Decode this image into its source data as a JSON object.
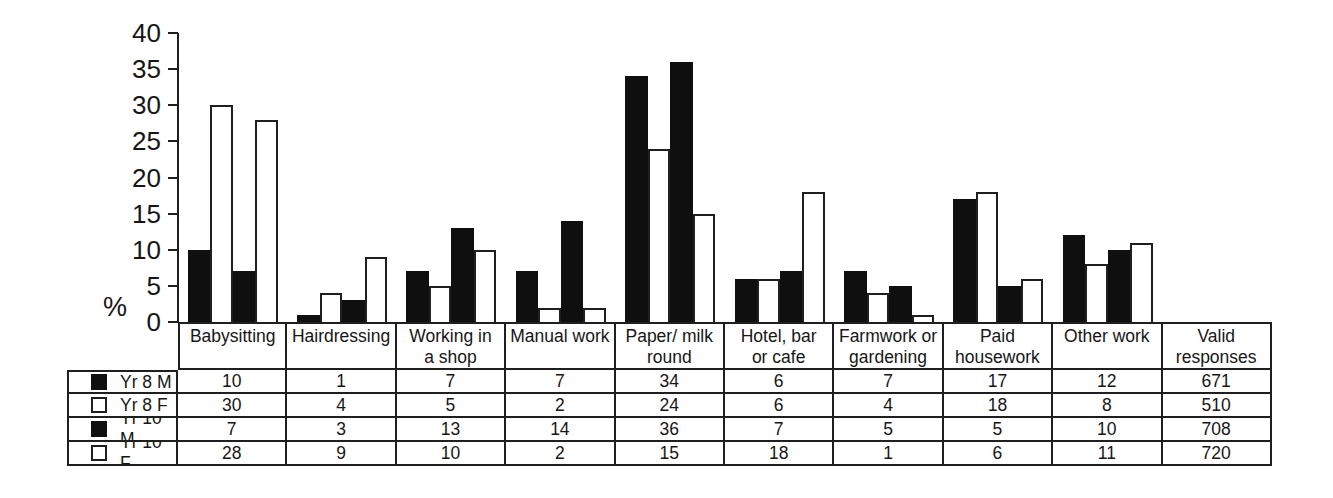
{
  "figure": {
    "background": "#ffffff",
    "line_color": "#1f1f1f",
    "bar_fill_dark": "#0f0f0f",
    "bar_fill_light": "#ffffff"
  },
  "chart": {
    "ylabel": "%",
    "yticks": [
      40,
      35,
      30,
      25,
      20,
      15,
      10,
      5,
      0
    ]
  },
  "chart_data": {
    "type": "bar",
    "title": "",
    "xlabel": "",
    "ylabel": "%",
    "ylim": [
      0,
      40
    ],
    "ytick_step": 5,
    "grid": false,
    "legend_position": "table-left",
    "categories": [
      "Babysitting",
      "Hairdressing",
      "Working in a shop",
      "Manual work",
      "Paper/ milk round",
      "Hotel, bar or cafe",
      "Farmwork or gardening",
      "Paid housework",
      "Other work"
    ],
    "series": [
      {
        "name": "Yr 8 M",
        "swatch": "black-filled-square",
        "color": "#0f0f0f",
        "values": [
          10,
          1,
          7,
          7,
          34,
          6,
          7,
          17,
          12
        ],
        "valid_responses": 671
      },
      {
        "name": "Yr 8 F",
        "swatch": "white-open-square",
        "color": "#ffffff",
        "values": [
          30,
          4,
          5,
          2,
          24,
          6,
          4,
          18,
          8
        ],
        "valid_responses": 510
      },
      {
        "name": "Yr 10 M",
        "swatch": "black-filled-square",
        "color": "#0f0f0f",
        "values": [
          7,
          3,
          13,
          14,
          36,
          7,
          5,
          5,
          10
        ],
        "valid_responses": 708
      },
      {
        "name": "Yr 10 F",
        "swatch": "white-open-square",
        "color": "#ffffff",
        "values": [
          28,
          9,
          10,
          2,
          15,
          18,
          1,
          6,
          11
        ],
        "valid_responses": 720
      }
    ]
  },
  "table": {
    "header_lines": [
      [
        "Babysitting"
      ],
      [
        "Hairdressing"
      ],
      [
        "Working in",
        "a shop"
      ],
      [
        "Manual work"
      ],
      [
        "Paper/ milk",
        "round"
      ],
      [
        "Hotel, bar",
        "or cafe"
      ],
      [
        "Farmwork or",
        "gardening"
      ],
      [
        "Paid",
        "housework"
      ],
      [
        "Other work"
      ],
      [
        "Valid",
        "responses"
      ]
    ]
  }
}
